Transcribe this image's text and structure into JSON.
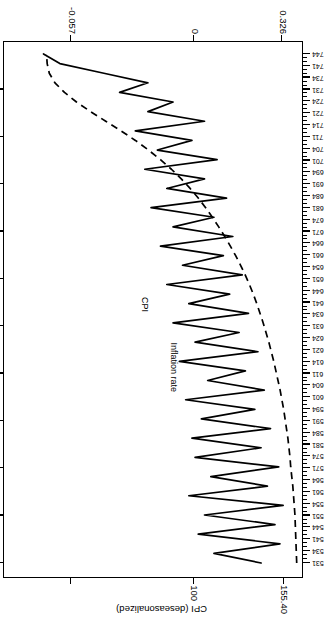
{
  "chart_data": {
    "type": "line",
    "title": "",
    "orientation": "rotated-180",
    "xlabel": "",
    "ylabel": "CPI (deseasonalized)",
    "top_axis": {
      "label": "CPI (deseasonalized)",
      "ticks": [
        {
          "value": 100,
          "label": "100"
        },
        {
          "value": 155.4,
          "label": "155.40"
        }
      ],
      "range": [
        83,
        168
      ]
    },
    "bottom_axis": {
      "label": "",
      "ticks": [
        {
          "value": -0.057,
          "label": "-0.057"
        },
        {
          "value": 0,
          "label": "0"
        },
        {
          "value": 0.326,
          "label": "0.326"
        }
      ],
      "range": [
        -0.085,
        0.392
      ]
    },
    "category_axis": {
      "label": "",
      "tick_labels": [
        "531",
        "534",
        "541",
        "544",
        "551",
        "554",
        "561",
        "564",
        "571",
        "574",
        "581",
        "584",
        "591",
        "594",
        "601",
        "604",
        "611",
        "614",
        "621",
        "624",
        "631",
        "634",
        "641",
        "644",
        "651",
        "654",
        "661",
        "664",
        "671",
        "674",
        "681",
        "684",
        "691",
        "694",
        "701",
        "704",
        "711",
        "714",
        "721",
        "724",
        "731",
        "734",
        "741",
        "744"
      ],
      "minor_ticks_between": 2
    },
    "grid": false,
    "legend": "inline-annotations",
    "annotations": [
      {
        "text": "CPI",
        "series": "cpi"
      },
      {
        "text": "Inflation rate",
        "series": "inflation"
      }
    ],
    "series": [
      {
        "name": "CPI",
        "label": "CPI",
        "axis": "top",
        "style": "dashed",
        "color": "#000000",
        "values": [
          84.5,
          84.6,
          84.7,
          84.8,
          84.9,
          85.0,
          85.2,
          85.4,
          85.6,
          85.9,
          86.2,
          86.4,
          86.7,
          87.0,
          87.4,
          87.8,
          88.2,
          88.7,
          89.2,
          89.8,
          90.4,
          91.0,
          91.7,
          92.4,
          93.2,
          94.0,
          94.9,
          95.8,
          96.8,
          97.9,
          99.1,
          100.4,
          101.8,
          103.3,
          104.9,
          106.6,
          108.4,
          110.3,
          112.4,
          114.7,
          117.2,
          120.0,
          123.1,
          126.5,
          130.2,
          134.3,
          138.6,
          142.9,
          146.9,
          150.3,
          153.0,
          154.6,
          155.2,
          155.4
        ]
      },
      {
        "name": "Inflation rate",
        "label": "Inflation rate",
        "axis": "bottom",
        "style": "solid",
        "color": "#000000",
        "values": [
          -0.02,
          0.055,
          -0.05,
          0.08,
          -0.042,
          0.07,
          -0.055,
          0.095,
          -0.03,
          0.06,
          -0.048,
          0.085,
          -0.02,
          0.09,
          -0.035,
          0.075,
          -0.01,
          0.1,
          -0.025,
          0.065,
          0.005,
          0.11,
          -0.015,
          0.085,
          0.015,
          0.12,
          0.0,
          0.095,
          0.03,
          0.13,
          0.01,
          0.105,
          0.04,
          0.14,
          0.025,
          0.12,
          0.055,
          0.155,
          0.035,
          0.13,
          0.07,
          0.165,
          0.05,
          0.145,
          0.09,
          0.18,
          0.07,
          0.16,
          0.12,
          0.205,
          0.16,
          0.23,
          0.3,
          0.326
        ]
      }
    ]
  },
  "axis_labels": {
    "cpi_title": "CPI (deseasonalized)",
    "cpi_tick_155": "155.40",
    "cpi_tick_100": "100",
    "infl_tick_0326": "0.326",
    "infl_tick_0": "0",
    "infl_tick_neg0057": "-0.057"
  },
  "series_annotations": {
    "cpi": "CPI",
    "inflation": "Inflation rate"
  }
}
